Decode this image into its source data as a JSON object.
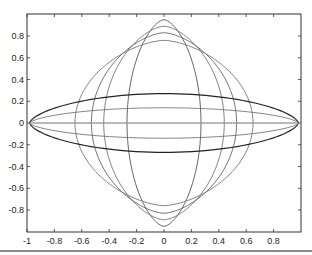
{
  "chart_data": {
    "type": "line",
    "title": "",
    "xlabel": "",
    "ylabel": "",
    "xlim": [
      -1,
      1
    ],
    "ylim": [
      -1,
      1
    ],
    "grid": false,
    "legend": null,
    "x_ticks": [
      -1,
      -0.8,
      -0.6,
      -0.4,
      -0.2,
      0,
      0.2,
      0.4,
      0.6,
      0.8
    ],
    "x_tick_labels": [
      "-1",
      "-0.8",
      "-0.6",
      "-0.4",
      "-0.2",
      "0",
      "0.2",
      "0.4",
      "0.6",
      "0.8"
    ],
    "y_ticks": [
      0.8,
      0.6,
      0.4,
      0.2,
      0,
      -0.2,
      -0.4,
      -0.6,
      -0.8
    ],
    "y_tick_labels": [
      "0.8",
      "0.6",
      "0.4",
      "0.2",
      "0",
      "-0.2",
      "-0.4",
      "-0.6",
      "-0.8"
    ],
    "series": [
      {
        "name": "vertical-lens-1",
        "orientation": "vertical",
        "half_width": 0.27,
        "half_height": 0.95,
        "color": "#555555"
      },
      {
        "name": "vertical-lens-2",
        "orientation": "vertical",
        "half_width": 0.44,
        "half_height": 0.89,
        "color": "#777777"
      },
      {
        "name": "vertical-lens-3",
        "orientation": "vertical",
        "half_width": 0.53,
        "half_height": 0.83,
        "color": "#666666"
      },
      {
        "name": "vertical-lens-4",
        "orientation": "vertical",
        "half_width": 0.65,
        "half_height": 0.76,
        "color": "#777777"
      },
      {
        "name": "horizontal-lens-1",
        "orientation": "horizontal",
        "half_width": 0.98,
        "half_height": 0.27,
        "color": "#222222"
      },
      {
        "name": "horizontal-lens-2",
        "orientation": "horizontal",
        "half_width": 0.98,
        "half_height": 0.14,
        "color": "#777777"
      },
      {
        "name": "horizontal-lens-3",
        "orientation": "horizontal",
        "half_width": 0.98,
        "half_height": 0.0,
        "color": "#999999"
      }
    ]
  },
  "layout": {
    "plot_left": 27,
    "plot_right": 301,
    "plot_top": 14,
    "plot_bottom": 232,
    "y_zero_px": 123
  }
}
